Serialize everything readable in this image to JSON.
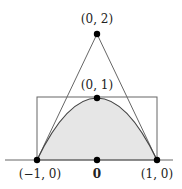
{
  "diagram": {
    "points": [
      {
        "id": "apex",
        "label": "(0, 2)"
      },
      {
        "id": "vertex",
        "label": "(0, 1)"
      },
      {
        "id": "left",
        "label": "(−1, 0)"
      },
      {
        "id": "origin",
        "label": "0"
      },
      {
        "id": "right",
        "label": "(1, 0)"
      }
    ],
    "colors": {
      "fill": "#e6e6e6",
      "stroke": "#555555",
      "dot": "#000000"
    }
  }
}
